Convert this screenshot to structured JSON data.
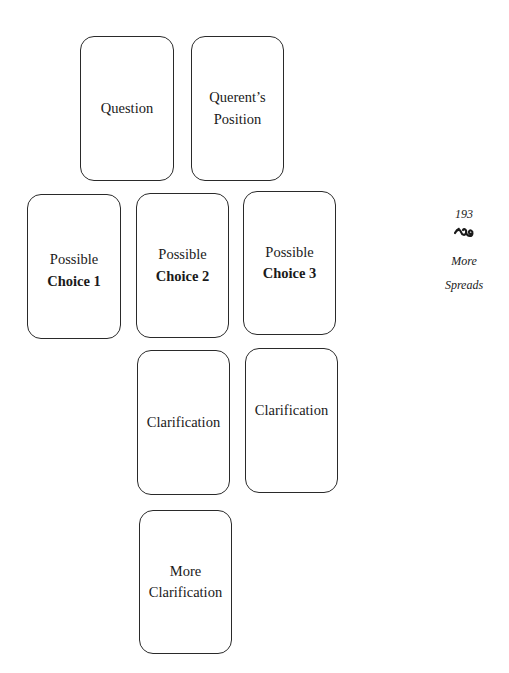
{
  "spread": {
    "cards": [
      {
        "id": "question",
        "lines": [
          {
            "text": "Question",
            "bold": false
          }
        ]
      },
      {
        "id": "querents-position",
        "lines": [
          {
            "text": "Querent’s",
            "bold": false
          },
          {
            "text": "Position",
            "bold": false
          }
        ]
      },
      {
        "id": "possible-choice-1",
        "lines": [
          {
            "text": "Possible",
            "bold": false
          },
          {
            "text": "Choice 1",
            "bold": true
          }
        ]
      },
      {
        "id": "possible-choice-2",
        "lines": [
          {
            "text": "Possible",
            "bold": false
          },
          {
            "text": "Choice 2",
            "bold": true
          }
        ]
      },
      {
        "id": "possible-choice-3",
        "lines": [
          {
            "text": "Possible",
            "bold": false
          },
          {
            "text": "Choice 3",
            "bold": true
          }
        ]
      },
      {
        "id": "clarification-1",
        "lines": [
          {
            "text": "Clarification",
            "bold": false
          }
        ]
      },
      {
        "id": "clarification-2",
        "lines": [
          {
            "text": "Clarification",
            "bold": false
          }
        ]
      },
      {
        "id": "more-clarification",
        "lines": [
          {
            "text": "More",
            "bold": false
          },
          {
            "text": "Clarification",
            "bold": false
          }
        ]
      }
    ]
  },
  "margin": {
    "page_number": "193",
    "ornament_icon": "fleuron-swirl-icon",
    "section_title_line1": "More",
    "section_title_line2": "Spreads"
  },
  "colors": {
    "card_border": "#2a2a2a",
    "text": "#1a1a1a",
    "background": "#ffffff"
  }
}
